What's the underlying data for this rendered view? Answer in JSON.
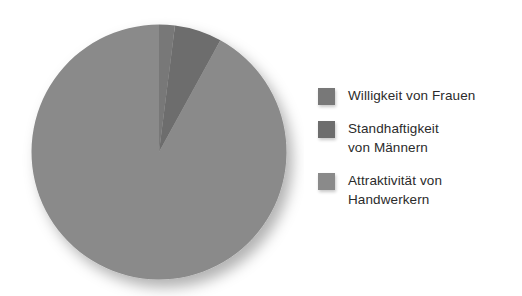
{
  "chart_data": {
    "type": "pie",
    "title": "",
    "categories": [
      "Willigkeit von Frauen",
      "Standhaftigkeit von Männern",
      "Attraktivität von Handwerkern"
    ],
    "values": [
      2,
      6,
      92
    ],
    "units": "percent",
    "start_angle_deg": 0,
    "direction": "clockwise",
    "slice_angles_deg": [
      7,
      22,
      331
    ],
    "colors": [
      "#787878",
      "#6d6d6d",
      "#8a8a8a"
    ],
    "legend_position": "right",
    "grid": false,
    "xlabel": "",
    "ylabel": "",
    "annotations": []
  },
  "chart": {
    "background": "#ffffff",
    "shadow_color": "rgba(0,0,0,0.28)"
  },
  "legend": {
    "entries": [
      {
        "label": "Willigkeit von Frauen",
        "color": "#787878",
        "swatch_name": "legend-swatch-willigkeit"
      },
      {
        "label": "Standhaftigkeit\nvon Männern",
        "color": "#6d6d6d",
        "swatch_name": "legend-swatch-standhaftigkeit"
      },
      {
        "label": "Attraktivität von\nHandwerkern",
        "color": "#8a8a8a",
        "swatch_name": "legend-swatch-attraktivitaet"
      }
    ]
  }
}
